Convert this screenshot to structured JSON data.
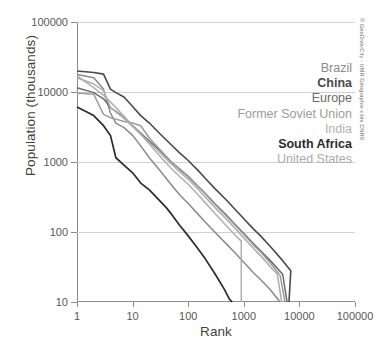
{
  "chart_data": {
    "type": "line",
    "title": "",
    "xlabel": "Rank",
    "ylabel": "Population (thousands)",
    "xscale": "log",
    "yscale": "log",
    "xlim": [
      1,
      100000
    ],
    "ylim": [
      10,
      100000
    ],
    "xticks": [
      "1",
      "10",
      "100",
      "1000",
      "10000",
      "100000"
    ],
    "yticks": [
      "10",
      "100",
      "1000",
      "10000",
      "100000"
    ],
    "grid": "horizontal",
    "legend_position": "right-inside",
    "credit": "© GeoDiverCity - UMR Géographie-cités CNRS",
    "series": [
      {
        "name": "Brazil",
        "color": "#8a8a8a",
        "width": 1.5,
        "bold_label": false,
        "points": [
          [
            1,
            17800
          ],
          [
            2,
            16000
          ],
          [
            3,
            11000
          ],
          [
            4,
            5000
          ],
          [
            5,
            3600
          ],
          [
            7,
            3100
          ],
          [
            10,
            2400
          ],
          [
            14,
            1700
          ],
          [
            20,
            1150
          ],
          [
            30,
            780
          ],
          [
            50,
            470
          ],
          [
            70,
            340
          ],
          [
            100,
            255
          ],
          [
            150,
            180
          ],
          [
            200,
            140
          ],
          [
            300,
            100
          ],
          [
            500,
            66
          ],
          [
            700,
            50
          ],
          [
            1000,
            37
          ],
          [
            1500,
            26
          ],
          [
            2000,
            21
          ],
          [
            3000,
            15
          ],
          [
            4500,
            10
          ]
        ]
      },
      {
        "name": "China",
        "color": "#4a4a4a",
        "width": 1.6,
        "bold_label": true,
        "points": [
          [
            1,
            20000
          ],
          [
            2,
            19000
          ],
          [
            3,
            18000
          ],
          [
            4,
            11000
          ],
          [
            5,
            9800
          ],
          [
            7,
            8500
          ],
          [
            10,
            6200
          ],
          [
            14,
            4600
          ],
          [
            20,
            3600
          ],
          [
            30,
            2600
          ],
          [
            50,
            1750
          ],
          [
            70,
            1350
          ],
          [
            100,
            1050
          ],
          [
            150,
            760
          ],
          [
            200,
            590
          ],
          [
            300,
            420
          ],
          [
            500,
            280
          ],
          [
            700,
            210
          ],
          [
            1000,
            155
          ],
          [
            1500,
            110
          ],
          [
            2000,
            88
          ],
          [
            3000,
            62
          ],
          [
            5000,
            39
          ],
          [
            7000,
            28
          ],
          [
            6500,
            10
          ]
        ]
      },
      {
        "name": "Europe",
        "color": "#6b6b6b",
        "width": 1.5,
        "bold_label": false,
        "points": [
          [
            1,
            11500
          ],
          [
            2,
            9800
          ],
          [
            3,
            8000
          ],
          [
            4,
            6000
          ],
          [
            5,
            5300
          ],
          [
            7,
            4300
          ],
          [
            10,
            3300
          ],
          [
            14,
            2600
          ],
          [
            20,
            2000
          ],
          [
            30,
            1500
          ],
          [
            50,
            1000
          ],
          [
            70,
            790
          ],
          [
            100,
            620
          ],
          [
            150,
            450
          ],
          [
            200,
            360
          ],
          [
            300,
            255
          ],
          [
            500,
            170
          ],
          [
            700,
            128
          ],
          [
            1000,
            95
          ],
          [
            1500,
            68
          ],
          [
            2000,
            54
          ],
          [
            3000,
            39
          ],
          [
            5000,
            25
          ],
          [
            6000,
            10
          ]
        ]
      },
      {
        "name": "Former Soviet Union",
        "color": "#9c9c9c",
        "width": 1.5,
        "bold_label": false,
        "points": [
          [
            1,
            9700
          ],
          [
            2,
            9300
          ],
          [
            3,
            4800
          ],
          [
            4,
            4300
          ],
          [
            5,
            4100
          ],
          [
            7,
            3800
          ],
          [
            10,
            3600
          ],
          [
            14,
            3300
          ],
          [
            20,
            2200
          ],
          [
            30,
            1550
          ],
          [
            50,
            1000
          ],
          [
            70,
            800
          ],
          [
            100,
            630
          ],
          [
            150,
            450
          ],
          [
            200,
            355
          ],
          [
            300,
            250
          ],
          [
            500,
            165
          ],
          [
            700,
            125
          ],
          [
            1000,
            92
          ],
          [
            1500,
            65
          ],
          [
            2000,
            52
          ],
          [
            3000,
            36
          ],
          [
            4500,
            24
          ],
          [
            5500,
            10
          ]
        ]
      },
      {
        "name": "India",
        "color": "#b0b0b0",
        "width": 1.5,
        "bold_label": false,
        "points": [
          [
            1,
            16000
          ],
          [
            2,
            13000
          ],
          [
            3,
            10500
          ],
          [
            4,
            6000
          ],
          [
            5,
            5200
          ],
          [
            7,
            4200
          ],
          [
            10,
            3200
          ],
          [
            14,
            2500
          ],
          [
            20,
            1800
          ],
          [
            30,
            1250
          ],
          [
            50,
            800
          ],
          [
            70,
            620
          ],
          [
            100,
            480
          ],
          [
            150,
            340
          ],
          [
            200,
            265
          ],
          [
            300,
            185
          ],
          [
            500,
            120
          ],
          [
            700,
            90
          ],
          [
            900,
            74
          ],
          [
            900,
            10
          ]
        ]
      },
      {
        "name": "South Africa",
        "color": "#2b2b2b",
        "width": 1.7,
        "bold_label": true,
        "points": [
          [
            1,
            6100
          ],
          [
            2,
            4600
          ],
          [
            3,
            3300
          ],
          [
            4,
            2400
          ],
          [
            5,
            1150
          ],
          [
            7,
            900
          ],
          [
            10,
            700
          ],
          [
            14,
            500
          ],
          [
            20,
            400
          ],
          [
            30,
            285
          ],
          [
            40,
            225
          ],
          [
            50,
            180
          ],
          [
            70,
            125
          ],
          [
            100,
            88
          ],
          [
            140,
            62
          ],
          [
            200,
            42
          ],
          [
            280,
            28
          ],
          [
            350,
            21
          ],
          [
            450,
            15
          ],
          [
            550,
            11
          ],
          [
            620,
            10
          ]
        ]
      },
      {
        "name": "United States",
        "color": "#ababab",
        "width": 1.5,
        "bold_label": false,
        "points": [
          [
            1,
            17000
          ],
          [
            2,
            11500
          ],
          [
            3,
            9000
          ],
          [
            4,
            7200
          ],
          [
            5,
            6000
          ],
          [
            7,
            4500
          ],
          [
            10,
            3300
          ],
          [
            14,
            2500
          ],
          [
            20,
            1900
          ],
          [
            30,
            1400
          ],
          [
            50,
            930
          ],
          [
            70,
            730
          ],
          [
            100,
            570
          ],
          [
            150,
            410
          ],
          [
            200,
            320
          ],
          [
            300,
            225
          ],
          [
            500,
            150
          ],
          [
            700,
            112
          ],
          [
            1000,
            82
          ],
          [
            1500,
            58
          ],
          [
            2000,
            46
          ],
          [
            3000,
            32
          ],
          [
            4000,
            25
          ],
          [
            4800,
            10
          ]
        ]
      }
    ]
  },
  "legend": {
    "items": [
      {
        "label": "Brazil"
      },
      {
        "label": "China"
      },
      {
        "label": "Europe"
      },
      {
        "label": "Former Soviet Union"
      },
      {
        "label": "India"
      },
      {
        "label": "South Africa"
      },
      {
        "label": "United States"
      }
    ]
  }
}
